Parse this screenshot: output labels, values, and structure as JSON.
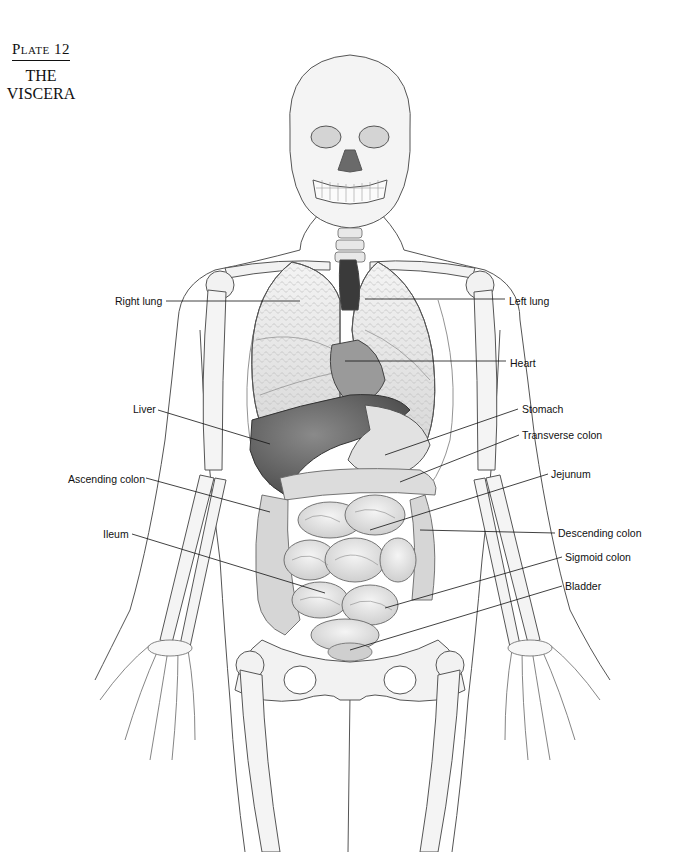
{
  "plate": {
    "number": "Plate 12",
    "title_line1": "THE",
    "title_line2": "VISCERA"
  },
  "labels": [
    {
      "id": "right-lung",
      "text": "Right lung",
      "x": 115,
      "y": 295,
      "line": [
        [
          166,
          301
        ],
        [
          300,
          301
        ]
      ]
    },
    {
      "id": "left-lung",
      "text": "Left lung",
      "x": 509,
      "y": 295,
      "line": [
        [
          365,
          299
        ],
        [
          505,
          299
        ]
      ]
    },
    {
      "id": "heart",
      "text": "Heart",
      "x": 510,
      "y": 357,
      "line": [
        [
          345,
          361
        ],
        [
          506,
          361
        ]
      ]
    },
    {
      "id": "liver",
      "text": "Liver",
      "x": 133,
      "y": 403,
      "line": [
        [
          158,
          410
        ],
        [
          270,
          444
        ]
      ]
    },
    {
      "id": "stomach",
      "text": "Stomach",
      "x": 522,
      "y": 403,
      "line": [
        [
          518,
          409
        ],
        [
          385,
          455
        ]
      ]
    },
    {
      "id": "transverse-colon",
      "text": "Transverse colon",
      "x": 522,
      "y": 429,
      "line": [
        [
          519,
          435
        ],
        [
          400,
          482
        ]
      ]
    },
    {
      "id": "ascending-colon",
      "text": "Ascending colon",
      "x": 68,
      "y": 473,
      "line": [
        [
          146,
          478
        ],
        [
          270,
          512
        ]
      ]
    },
    {
      "id": "jejunum",
      "text": "Jejunum",
      "x": 551,
      "y": 468,
      "line": [
        [
          548,
          474
        ],
        [
          370,
          530
        ]
      ]
    },
    {
      "id": "ileum",
      "text": "Ileum",
      "x": 103,
      "y": 528,
      "line": [
        [
          132,
          534
        ],
        [
          325,
          593
        ]
      ]
    },
    {
      "id": "descending-colon",
      "text": "Descending colon",
      "x": 558,
      "y": 527,
      "line": [
        [
          555,
          533
        ],
        [
          420,
          530
        ]
      ]
    },
    {
      "id": "sigmoid-colon",
      "text": "Sigmoid colon",
      "x": 565,
      "y": 551,
      "line": [
        [
          562,
          557
        ],
        [
          385,
          608
        ]
      ]
    },
    {
      "id": "bladder",
      "text": "Bladder",
      "x": 565,
      "y": 580,
      "line": [
        [
          562,
          586
        ],
        [
          350,
          650
        ]
      ]
    }
  ],
  "colors": {
    "ink": "#111111",
    "outline": "#555555",
    "bone": "#f2f2f2",
    "organ_light": "#e6e6e6",
    "organ_mid": "#bdbdbd",
    "organ_dark": "#6e6e6e",
    "vessel": "#3a3a3a"
  }
}
